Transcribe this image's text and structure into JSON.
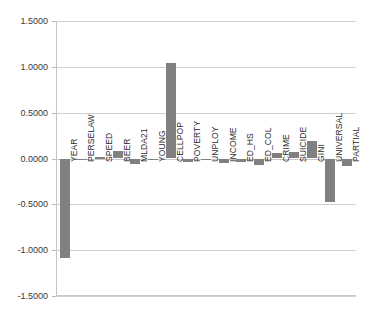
{
  "chart_data": {
    "type": "bar",
    "title": "",
    "xlabel": "",
    "ylabel": "",
    "ylim": [
      -1.5,
      1.5
    ],
    "grid": true,
    "legend": false,
    "orientation": "vertical",
    "bar_color": "#808080",
    "categories": [
      "YEAR",
      "PERSELAW",
      "SPEED",
      "BEER",
      "MLDA21",
      "YOUNG",
      "CELLPOP",
      "POVERTY",
      "UNPLOY",
      "INCOME",
      "ED_HS",
      "ED_COL",
      "CRIME",
      "SUICIDE",
      "GINI",
      "UNIVERSAL",
      "PARTIAL"
    ],
    "values": [
      -1.09,
      -0.008,
      0.015,
      0.078,
      -0.062,
      -0.012,
      1.04,
      -0.04,
      -0.007,
      -0.047,
      -0.043,
      -0.07,
      0.058,
      0.07,
      0.193,
      -0.47,
      -0.083
    ],
    "ytick_labels": [
      "1.5000",
      "1.0000",
      "0.5000",
      "0.0000",
      "-0.5000",
      "-1.0000",
      "-1.5000"
    ],
    "ytick_values": [
      1.5,
      1.0,
      0.5,
      0.0,
      -0.5,
      -1.0,
      -1.5
    ]
  }
}
